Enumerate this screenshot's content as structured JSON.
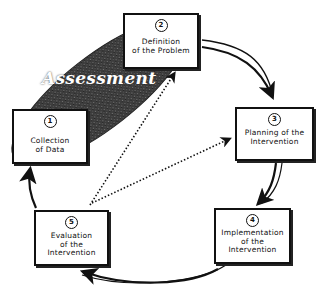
{
  "diagram": {
    "phase_label": "Assessment",
    "colors": {
      "assessment_fill": "#3a3a3a",
      "box_border": "#111111",
      "arrow": "#111111",
      "background": "#ffffff"
    },
    "steps": [
      {
        "number": "1",
        "label": "Collection\nof Data"
      },
      {
        "number": "2",
        "label": "Definition\nof the Problem"
      },
      {
        "number": "3",
        "label": "Planning of the\nIntervention"
      },
      {
        "number": "4",
        "label": "Implementation\nof the\nIntervention"
      },
      {
        "number": "5",
        "label": "Evaluation\nof the\nIntervention"
      }
    ],
    "cycle_arrows": [
      {
        "from": "2",
        "to": "3",
        "style": "curved-solid"
      },
      {
        "from": "3",
        "to": "4",
        "style": "curved-solid"
      },
      {
        "from": "4",
        "to": "5",
        "style": "curved-solid"
      },
      {
        "from": "5",
        "to": "1",
        "style": "curved-solid"
      }
    ],
    "feedback_arrows": [
      {
        "from": "5",
        "to": "2",
        "style": "dotted"
      },
      {
        "from": "5",
        "to": "3",
        "style": "dotted"
      }
    ],
    "grouping": {
      "label": "Assessment",
      "includes": [
        "1",
        "2"
      ]
    }
  }
}
